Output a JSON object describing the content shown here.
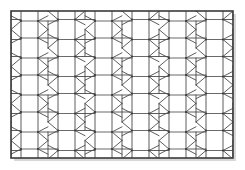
{
  "figure": {
    "title": "Geometric Tiling Pattern",
    "caption": "",
    "kind": "line-art-tessellation",
    "canvas": {
      "width": 245,
      "height": 170
    },
    "background_color": "#ffffff"
  },
  "frame": {
    "name": "border-rectangle",
    "x": 11,
    "y": 11,
    "width": 222,
    "height": 147,
    "stroke_color": "#3a3a3a",
    "stroke_width": 1.6,
    "fill_color": "#ffffff"
  },
  "shadow": {
    "name": "drop-shadow",
    "offset_x": 3,
    "offset_y": 3,
    "color": "#d8d8d8",
    "visible": true
  },
  "pattern": {
    "name": "square-octagon-tiling",
    "stroke_color": "#4a4a4a",
    "stroke_width": 0.9,
    "accent_stroke_color": "#6a6a6a",
    "node_color": "#3a3a3a",
    "node_radius": 0.9,
    "cell_width": 37,
    "cell_height": 37,
    "column_offset_ratio": 0.5,
    "square_size": 17,
    "columns": 6,
    "rows": 4,
    "origin_x": 11,
    "origin_y": 11,
    "description": "Axis-aligned squares connected by elongated octagons and hexagons, with triangular fans radiating from square corners; adjacent columns offset by half a vertical period."
  },
  "chart_data": {
    "type": "diagram",
    "title": "Geometric Tiling Pattern",
    "xlabel": "",
    "ylabel": "",
    "grid": false,
    "legend": [],
    "annotations": [],
    "motifs": [
      {
        "shape": "square",
        "count_approx": 24,
        "orientation": "axis-aligned"
      },
      {
        "shape": "octagon",
        "count_approx": 18,
        "orientation": "elongated-horizontal"
      },
      {
        "shape": "hexagon",
        "count_approx": 20,
        "orientation": "vertical"
      },
      {
        "shape": "triangle",
        "count_approx": 48,
        "orientation": "fan"
      }
    ]
  }
}
